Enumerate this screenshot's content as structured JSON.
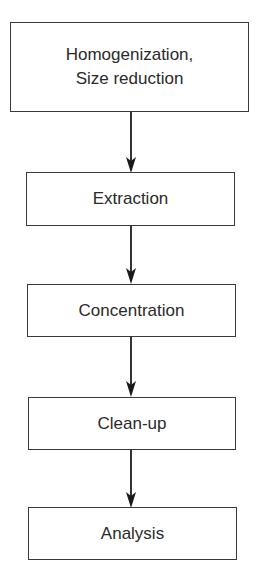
{
  "diagram": {
    "type": "flowchart",
    "direction": "top-to-bottom",
    "steps": [
      {
        "label": "Homogenization,\nSize reduction",
        "line1": "Homogenization,",
        "line2": "Size reduction"
      },
      {
        "label": "Extraction"
      },
      {
        "label": "Concentration"
      },
      {
        "label": "Clean-up"
      },
      {
        "label": "Analysis"
      }
    ],
    "edges": [
      {
        "from": "Homogenization, Size reduction",
        "to": "Extraction"
      },
      {
        "from": "Extraction",
        "to": "Concentration"
      },
      {
        "from": "Concentration",
        "to": "Clean-up"
      },
      {
        "from": "Clean-up",
        "to": "Analysis"
      }
    ],
    "colors": {
      "stroke": "#333333",
      "text": "#2a2a2a",
      "background": "#ffffff"
    }
  }
}
